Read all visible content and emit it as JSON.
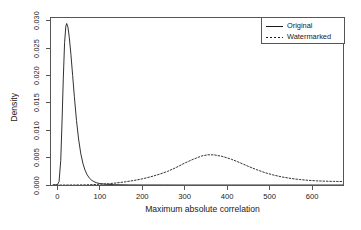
{
  "chart_data": {
    "type": "line",
    "title": "",
    "xlabel": "Maximum absolute correlation",
    "ylabel": "Density",
    "xlim": [
      -15,
      673
    ],
    "ylim": [
      0.0,
      0.0305
    ],
    "xticks": [
      0,
      100,
      200,
      300,
      400,
      500,
      600
    ],
    "xtick_labels": [
      "0",
      "100",
      "200",
      "300",
      "400",
      "500",
      "600"
    ],
    "yticks": [
      0.0,
      0.005,
      0.01,
      0.015,
      0.02,
      0.025,
      0.03
    ],
    "ytick_labels": [
      "0.000",
      "0.005",
      "0.010",
      "0.015",
      "0.020",
      "0.025",
      "0.030"
    ],
    "grid": false,
    "legend_position": "top-right",
    "legend": [
      "Original",
      "Watermarked"
    ],
    "series": [
      {
        "name": "Original",
        "style": "solid",
        "color": "#1a1a1a",
        "x": [
          -10,
          0,
          4,
          8,
          11,
          14,
          17,
          20,
          22,
          25,
          28,
          32,
          36,
          40,
          45,
          50,
          55,
          60,
          65,
          70,
          75,
          80,
          86,
          92,
          100,
          110,
          120,
          135,
          150,
          170,
          200,
          250,
          300,
          400,
          500,
          600,
          673
        ],
        "y": [
          0.0,
          5e-05,
          0.0006,
          0.0045,
          0.0115,
          0.0195,
          0.026,
          0.029,
          0.0295,
          0.0288,
          0.027,
          0.0238,
          0.02,
          0.0162,
          0.0118,
          0.0084,
          0.0058,
          0.004,
          0.00275,
          0.0019,
          0.0013,
          0.00092,
          0.00062,
          0.00042,
          0.00026,
          0.00016,
          0.0001,
          6e-05,
          4e-05,
          2e-05,
          1e-05,
          1e-05,
          0.0,
          0.0,
          0.0,
          0.0,
          0.0
        ]
      },
      {
        "name": "Watermarked",
        "style": "dashed",
        "color": "#1a1a1a",
        "x": [
          -10,
          0,
          20,
          40,
          60,
          75,
          90,
          105,
          120,
          140,
          160,
          180,
          200,
          220,
          240,
          260,
          280,
          300,
          320,
          340,
          355,
          370,
          390,
          410,
          430,
          450,
          470,
          490,
          510,
          530,
          550,
          570,
          590,
          610,
          630,
          650,
          673
        ],
        "y": [
          0.0,
          0.0,
          0.0,
          1e-05,
          2e-05,
          5e-05,
          0.0001,
          0.00016,
          0.00024,
          0.00038,
          0.00058,
          0.00082,
          0.00112,
          0.0015,
          0.00196,
          0.0025,
          0.0032,
          0.004,
          0.0047,
          0.0053,
          0.00552,
          0.0055,
          0.0052,
          0.0047,
          0.00408,
          0.0034,
          0.00278,
          0.00224,
          0.0018,
          0.00146,
          0.0012,
          0.001,
          0.00086,
          0.00076,
          0.0007,
          0.00066,
          0.00064
        ]
      }
    ]
  }
}
